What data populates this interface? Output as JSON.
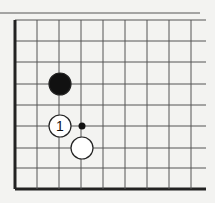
{
  "diagram": {
    "type": "go-board-corner",
    "colors": {
      "background": "#f3f3f1",
      "line": "#555555",
      "edge": "#222222",
      "black_stone": "#111111",
      "white_stone": "#ffffff",
      "stone_outline": "#222222"
    },
    "grid": {
      "x_lines": [
        15,
        37,
        59,
        81,
        103,
        125,
        147,
        169,
        191
      ],
      "y_lines": [
        20,
        41,
        62,
        84,
        105,
        126,
        148,
        168,
        189
      ],
      "right_extent": 206,
      "top_rule": {
        "y": 13,
        "x1": 0,
        "x2": 200
      }
    },
    "stones": [
      {
        "color": "black",
        "x": 60,
        "y": 84,
        "label": ""
      },
      {
        "color": "white",
        "x": 60,
        "y": 126,
        "label": "1"
      },
      {
        "color": "white",
        "x": 82,
        "y": 148,
        "label": ""
      }
    ],
    "markers": [
      {
        "type": "dot",
        "x": 82,
        "y": 126
      }
    ],
    "move_label": "1"
  }
}
